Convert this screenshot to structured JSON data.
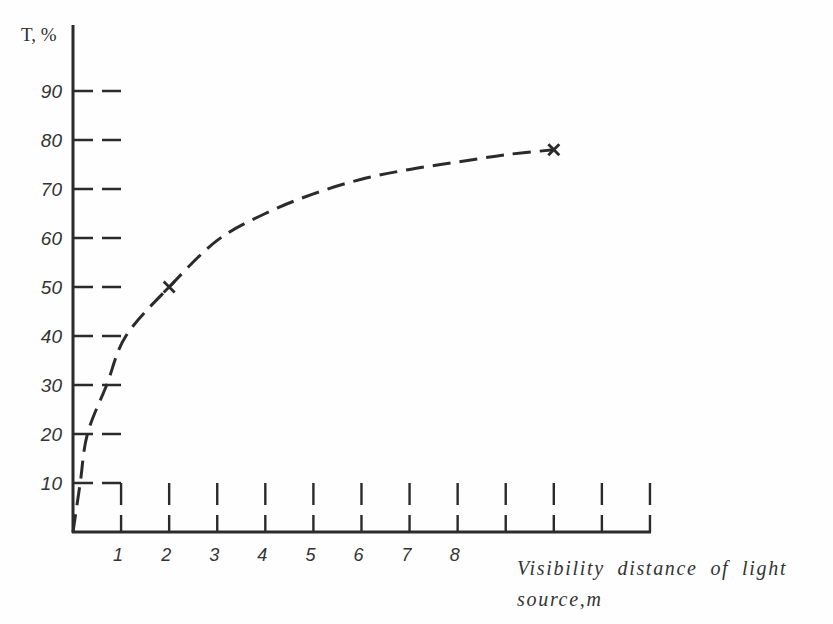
{
  "chart_data": {
    "type": "line",
    "title": "",
    "ylabel": "T, %",
    "xlabel": "Visibility distance of light source,m",
    "xlabel_lines": [
      "Visibility distance of light",
      "source,m"
    ],
    "xlim": [
      0,
      12
    ],
    "ylim": [
      0,
      103
    ],
    "grid": false,
    "legend": null,
    "x_ticks": [
      1,
      2,
      3,
      4,
      5,
      6,
      7,
      8,
      9,
      10,
      11,
      12
    ],
    "x_tick_labels": [
      "1",
      "2",
      "3",
      "4",
      "5",
      "6",
      "7",
      "8",
      "",
      "",
      "",
      ""
    ],
    "y_ticks": [
      10,
      20,
      30,
      40,
      50,
      60,
      70,
      80,
      90
    ],
    "y_tick_labels": [
      "10",
      "20",
      "30",
      "40",
      "50",
      "60",
      "70",
      "80",
      "90"
    ],
    "series": [
      {
        "name": "T",
        "line_style": "dashed",
        "x": [
          0,
          0.15,
          0.3,
          0.7,
          1.1,
          2,
          3,
          4,
          5,
          6,
          7,
          8,
          9,
          10
        ],
        "y": [
          0,
          10,
          20,
          30,
          40,
          50,
          59.5,
          65,
          69,
          72,
          74,
          75.5,
          77,
          78
        ]
      }
    ],
    "markers": [
      {
        "x": 2,
        "y": 50,
        "symbol": "x"
      },
      {
        "x": 10,
        "y": 78,
        "symbol": "x"
      }
    ]
  },
  "colors": {
    "ink": "#2b2b2b",
    "text": "#333333",
    "background": "#fefefe"
  }
}
